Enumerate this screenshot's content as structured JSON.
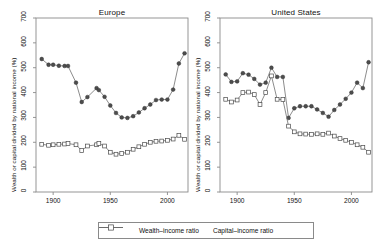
{
  "chart_data": {
    "type": "line",
    "title": "",
    "ylabel": "Wealth or capital divided by national income (%)",
    "xlabel": "",
    "ylim": [
      0,
      700
    ],
    "xlim": [
      1885,
      2018
    ],
    "yticks": [
      0,
      100,
      200,
      300,
      400,
      500,
      600,
      700
    ],
    "xticks": [
      1900,
      1950,
      2000
    ],
    "grid": false,
    "legend_position": "bottom",
    "legend": [
      "Wealth–income ratio",
      "Capital–income ratio"
    ],
    "panels": [
      {
        "title": "Europe",
        "series": [
          {
            "name": "Wealth–income ratio",
            "marker": "filled-circle",
            "color": "#555555",
            "x": [
              1890,
              1896,
              1900,
              1905,
              1910,
              1913,
              1920,
              1925,
              1930,
              1938,
              1940,
              1945,
              1950,
              1955,
              1960,
              1965,
              1970,
              1975,
              1980,
              1985,
              1990,
              1995,
              2000,
              2005,
              2010,
              2015
            ],
            "y": [
              535,
              512,
              512,
              508,
              507,
              507,
              440,
              362,
              382,
              418,
              410,
              383,
              348,
              318,
              300,
              298,
              305,
              320,
              337,
              352,
              370,
              372,
              372,
              412,
              517,
              558
            ]
          },
          {
            "name": "Capital–income ratio",
            "marker": "open-square",
            "color": "#666666",
            "x": [
              1890,
              1896,
              1900,
              1905,
              1910,
              1913,
              1920,
              1925,
              1930,
              1938,
              1940,
              1945,
              1950,
              1955,
              1960,
              1965,
              1970,
              1975,
              1980,
              1985,
              1990,
              1995,
              2000,
              2005,
              2010,
              2015
            ],
            "y": [
              192,
              188,
              190,
              192,
              193,
              195,
              190,
              167,
              185,
              190,
              195,
              185,
              160,
              152,
              155,
              160,
              172,
              182,
              192,
              200,
              204,
              205,
              208,
              213,
              228,
              212
            ]
          }
        ]
      },
      {
        "title": "United States",
        "series": [
          {
            "name": "Wealth–income ratio",
            "marker": "filled-circle",
            "color": "#555555",
            "x": [
              1890,
              1895,
              1900,
              1905,
              1910,
              1915,
              1920,
              1925,
              1930,
              1935,
              1940,
              1945,
              1950,
              1955,
              1960,
              1965,
              1970,
              1975,
              1980,
              1985,
              1990,
              1995,
              2000,
              2005,
              2010,
              2015
            ],
            "y": [
              473,
              443,
              445,
              478,
              472,
              455,
              432,
              440,
              500,
              463,
              463,
              298,
              337,
              345,
              345,
              345,
              332,
              318,
              303,
              330,
              352,
              375,
              400,
              440,
              418,
              522
            ]
          },
          {
            "name": "Capital–income ratio",
            "marker": "open-square",
            "color": "#666666",
            "x": [
              1890,
              1895,
              1900,
              1905,
              1910,
              1915,
              1920,
              1925,
              1930,
              1935,
              1940,
              1945,
              1950,
              1955,
              1960,
              1965,
              1970,
              1975,
              1980,
              1985,
              1990,
              1995,
              2000,
              2005,
              2010,
              2015
            ],
            "y": [
              373,
              362,
              370,
              400,
              402,
              392,
              352,
              400,
              467,
              373,
              372,
              265,
              242,
              234,
              233,
              232,
              234,
              232,
              237,
              225,
              215,
              208,
              200,
              190,
              180,
              160
            ]
          }
        ]
      }
    ]
  },
  "axis": {
    "ylabel": "Wealth or capital divided by national income (%)",
    "ytick_labels": [
      "0",
      "100",
      "200",
      "300",
      "400",
      "500",
      "600",
      "700"
    ],
    "xtick_labels": [
      "1900",
      "1950",
      "2000"
    ]
  },
  "panels": {
    "europe_title": "Europe",
    "us_title": "United States"
  },
  "legend": {
    "wealth_label": "Wealth–income ratio",
    "capital_label": "Capital–income ratio"
  }
}
